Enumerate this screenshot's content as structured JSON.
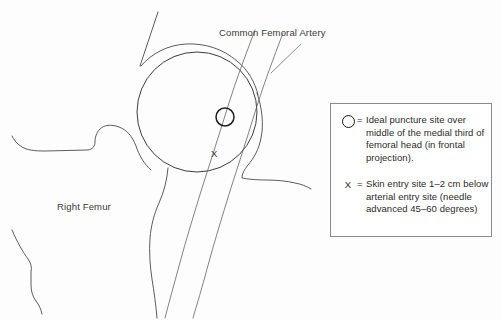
{
  "diagram": {
    "background_color": "#fdfdfd",
    "stroke_color": "#3a3a3a",
    "labels": {
      "artery": "Common Femoral Artery",
      "femur": "Right Femur",
      "skin_entry_marker": "X"
    },
    "structures": {
      "femoral_head": {
        "name": "femoral-head",
        "center_x": 197,
        "center_y": 112,
        "radius": 60
      },
      "puncture_site": {
        "name": "ideal-puncture-site",
        "center_x": 225,
        "center_y": 117,
        "radius": 9
      },
      "skin_entry_site": {
        "name": "skin-entry-site",
        "x": 216,
        "y": 155
      }
    }
  },
  "legend": {
    "border_color": "#8a8a8a",
    "background_color": "#ffffff",
    "entries": [
      {
        "key_type": "circle",
        "equals": "=",
        "text": "Ideal puncture site over middle of the medial third of femoral head (in frontal projection)."
      },
      {
        "key_type": "x",
        "key_label": "X",
        "equals": "=",
        "text": "Skin entry site 1–2 cm below arterial entry site (needle advanced 45–60 degrees)"
      }
    ]
  }
}
